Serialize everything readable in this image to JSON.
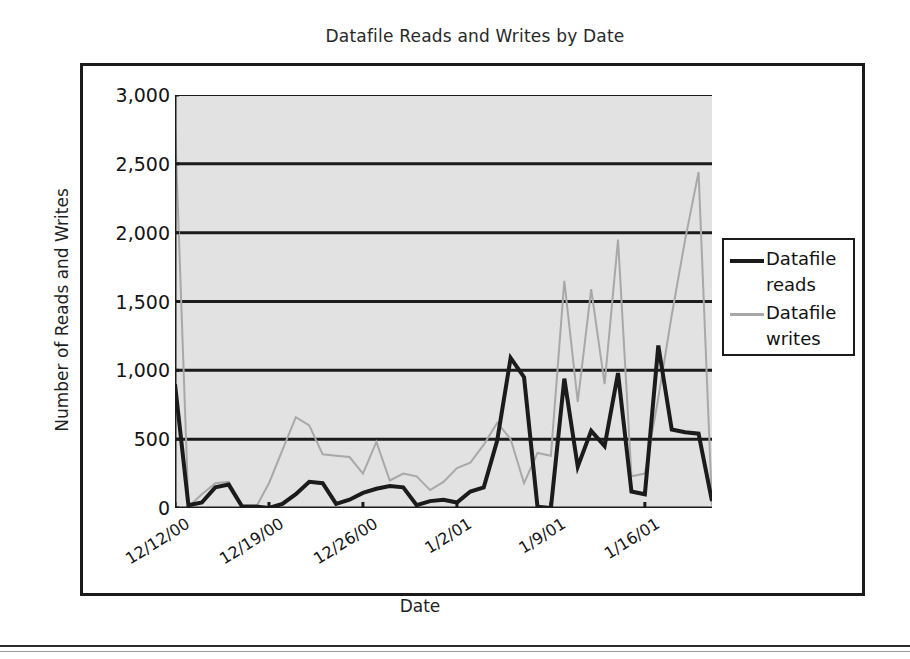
{
  "figure": {
    "title": "Datafile Reads and Writes by Date"
  },
  "legend": {
    "items": [
      {
        "label": "Datafile reads",
        "color": "#1b1b1b",
        "width": 4
      },
      {
        "label": "Datafile writes",
        "color": "#a8a8a8",
        "width": 2
      }
    ]
  },
  "chart_data": {
    "type": "line",
    "title": "Datafile Reads and Writes by Date",
    "xlabel": "Date",
    "ylabel": "Number of Reads and Writes",
    "ylim": [
      0,
      3000
    ],
    "ytick_labels": [
      "0",
      "500",
      "1,000",
      "1,500",
      "2,000",
      "2,500",
      "3,000"
    ],
    "ytick_values": [
      0,
      500,
      1000,
      1500,
      2000,
      2500,
      3000
    ],
    "grid": "horizontal",
    "plot_bg": "#e2e2e2",
    "legend_position": "right",
    "xtick_labels": [
      "12/12/00",
      "12/19/00",
      "12/26/00",
      "1/2/01",
      "1/9/01",
      "1/16/01"
    ],
    "xtick_indices": [
      0,
      7,
      14,
      21,
      28,
      35
    ],
    "x": [
      "12/12/00",
      "12/13/00",
      "12/14/00",
      "12/15/00",
      "12/16/00",
      "12/17/00",
      "12/18/00",
      "12/19/00",
      "12/20/00",
      "12/21/00",
      "12/22/00",
      "12/23/00",
      "12/24/00",
      "12/25/00",
      "12/26/00",
      "12/27/00",
      "12/28/00",
      "12/29/00",
      "12/30/00",
      "12/31/00",
      "1/1/01",
      "1/2/01",
      "1/3/01",
      "1/4/01",
      "1/5/01",
      "1/6/01",
      "1/7/01",
      "1/8/01",
      "1/9/01",
      "1/10/01",
      "1/11/01",
      "1/12/01",
      "1/13/01",
      "1/14/01",
      "1/15/01",
      "1/16/01",
      "1/17/01",
      "1/18/01",
      "1/19/01",
      "1/20/01",
      "1/21/01"
    ],
    "series": [
      {
        "name": "Datafile reads",
        "color": "#1b1b1b",
        "line_width": 4,
        "values": [
          900,
          20,
          40,
          150,
          170,
          10,
          10,
          0,
          30,
          100,
          190,
          180,
          30,
          60,
          110,
          140,
          160,
          150,
          20,
          50,
          60,
          40,
          120,
          150,
          490,
          1090,
          950,
          10,
          0,
          940,
          300,
          560,
          450,
          980,
          120,
          100,
          1180,
          570,
          550,
          540,
          50
        ]
      },
      {
        "name": "Datafile writes",
        "color": "#a8a8a8",
        "line_width": 2,
        "values": [
          2780,
          10,
          100,
          180,
          190,
          10,
          0,
          180,
          420,
          660,
          600,
          390,
          380,
          370,
          250,
          480,
          200,
          250,
          230,
          130,
          190,
          290,
          330,
          460,
          620,
          500,
          180,
          400,
          380,
          1650,
          770,
          1590,
          900,
          1950,
          230,
          250,
          800,
          1400,
          1950,
          2440,
          20
        ]
      }
    ]
  }
}
